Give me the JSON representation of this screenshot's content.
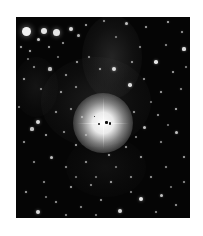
{
  "image": {
    "subject": "star field with bright central star and surrounding reflection nebula",
    "background_color": "#ffffff",
    "sky_color": "#050505",
    "frame": {
      "left": 16,
      "top": 17,
      "width": 174,
      "height": 201
    }
  },
  "central_star": {
    "x": 87,
    "y": 106,
    "core_radius": 8,
    "halo_radius": 30,
    "spike_length": 52,
    "color": "#ffffff"
  },
  "nebulae": [
    {
      "x": 96,
      "y": 40,
      "rx": 30,
      "ry": 42,
      "opacity": 0.16
    },
    {
      "x": 80,
      "y": 85,
      "rx": 55,
      "ry": 45,
      "opacity": 0.12
    },
    {
      "x": 20,
      "y": 70,
      "rx": 22,
      "ry": 30,
      "opacity": 0.08
    },
    {
      "x": 90,
      "y": 150,
      "rx": 40,
      "ry": 30,
      "opacity": 0.06
    }
  ],
  "core_blemishes": [
    {
      "x": 82,
      "y": 106,
      "w": 2,
      "h": 2
    },
    {
      "x": 89,
      "y": 104,
      "w": 3,
      "h": 3
    },
    {
      "x": 93,
      "y": 105,
      "w": 2,
      "h": 3
    },
    {
      "x": 78,
      "y": 99,
      "w": 1,
      "h": 1
    }
  ],
  "stars": [
    {
      "x": 10,
      "y": 14,
      "r": 4.5,
      "b": 0.95
    },
    {
      "x": 28,
      "y": 14,
      "r": 3,
      "b": 0.9
    },
    {
      "x": 40,
      "y": 15,
      "r": 3.5,
      "b": 0.9
    },
    {
      "x": 22,
      "y": 22,
      "r": 1.5,
      "b": 0.8
    },
    {
      "x": 55,
      "y": 12,
      "r": 2,
      "b": 0.85
    },
    {
      "x": 62,
      "y": 18,
      "r": 1.5,
      "b": 0.7
    },
    {
      "x": 5,
      "y": 30,
      "r": 1.2,
      "b": 0.7
    },
    {
      "x": 14,
      "y": 34,
      "r": 1.4,
      "b": 0.75
    },
    {
      "x": 33,
      "y": 30,
      "r": 1.2,
      "b": 0.7
    },
    {
      "x": 47,
      "y": 26,
      "r": 1.1,
      "b": 0.65
    },
    {
      "x": 70,
      "y": 8,
      "r": 1.3,
      "b": 0.7
    },
    {
      "x": 88,
      "y": 4,
      "r": 1.2,
      "b": 0.6
    },
    {
      "x": 110,
      "y": 6,
      "r": 1.5,
      "b": 0.75
    },
    {
      "x": 130,
      "y": 10,
      "r": 1.3,
      "b": 0.7
    },
    {
      "x": 152,
      "y": 5,
      "r": 1.4,
      "b": 0.75
    },
    {
      "x": 166,
      "y": 15,
      "r": 1.2,
      "b": 0.65
    },
    {
      "x": 168,
      "y": 32,
      "r": 1.6,
      "b": 0.85
    },
    {
      "x": 150,
      "y": 28,
      "r": 1.2,
      "b": 0.6
    },
    {
      "x": 140,
      "y": 45,
      "r": 1.8,
      "b": 0.9
    },
    {
      "x": 157,
      "y": 55,
      "r": 1.3,
      "b": 0.7
    },
    {
      "x": 124,
      "y": 30,
      "r": 1.1,
      "b": 0.6
    },
    {
      "x": 116,
      "y": 45,
      "r": 1.2,
      "b": 0.65
    },
    {
      "x": 98,
      "y": 52,
      "r": 2,
      "b": 0.85
    },
    {
      "x": 84,
      "y": 52,
      "r": 1.4,
      "b": 0.7
    },
    {
      "x": 73,
      "y": 40,
      "r": 1.2,
      "b": 0.6
    },
    {
      "x": 61,
      "y": 45,
      "r": 1.3,
      "b": 0.7
    },
    {
      "x": 50,
      "y": 58,
      "r": 1.2,
      "b": 0.65
    },
    {
      "x": 34,
      "y": 52,
      "r": 1.6,
      "b": 0.75
    },
    {
      "x": 18,
      "y": 50,
      "r": 1.1,
      "b": 0.6
    },
    {
      "x": 8,
      "y": 62,
      "r": 1.3,
      "b": 0.7
    },
    {
      "x": 25,
      "y": 72,
      "r": 1.2,
      "b": 0.6
    },
    {
      "x": 45,
      "y": 75,
      "r": 1.4,
      "b": 0.7
    },
    {
      "x": 60,
      "y": 70,
      "r": 1.1,
      "b": 0.6
    },
    {
      "x": 114,
      "y": 68,
      "r": 1.8,
      "b": 0.85
    },
    {
      "x": 128,
      "y": 62,
      "r": 1.2,
      "b": 0.65
    },
    {
      "x": 145,
      "y": 75,
      "r": 1.3,
      "b": 0.7
    },
    {
      "x": 165,
      "y": 72,
      "r": 1.2,
      "b": 0.6
    },
    {
      "x": 160,
      "y": 92,
      "r": 1.4,
      "b": 0.75
    },
    {
      "x": 142,
      "y": 98,
      "r": 1.2,
      "b": 0.65
    },
    {
      "x": 128,
      "y": 110,
      "r": 1.5,
      "b": 0.75
    },
    {
      "x": 118,
      "y": 95,
      "r": 1.2,
      "b": 0.65
    },
    {
      "x": 66,
      "y": 100,
      "r": 1.3,
      "b": 0.7
    },
    {
      "x": 55,
      "y": 92,
      "r": 1.1,
      "b": 0.6
    },
    {
      "x": 40,
      "y": 95,
      "r": 1.2,
      "b": 0.65
    },
    {
      "x": 22,
      "y": 105,
      "r": 2.2,
      "b": 0.85
    },
    {
      "x": 16,
      "y": 112,
      "r": 1.6,
      "b": 0.75
    },
    {
      "x": 30,
      "y": 118,
      "r": 1.3,
      "b": 0.7
    },
    {
      "x": 8,
      "y": 125,
      "r": 1.2,
      "b": 0.65
    },
    {
      "x": 48,
      "y": 115,
      "r": 1.2,
      "b": 0.6
    },
    {
      "x": 60,
      "y": 128,
      "r": 1.4,
      "b": 0.7
    },
    {
      "x": 35,
      "y": 140,
      "r": 1.5,
      "b": 0.75
    },
    {
      "x": 18,
      "y": 145,
      "r": 1.2,
      "b": 0.6
    },
    {
      "x": 50,
      "y": 150,
      "r": 1.2,
      "b": 0.6
    },
    {
      "x": 70,
      "y": 145,
      "r": 1.3,
      "b": 0.65
    },
    {
      "x": 93,
      "y": 138,
      "r": 1.4,
      "b": 0.7
    },
    {
      "x": 110,
      "y": 130,
      "r": 1.2,
      "b": 0.65
    },
    {
      "x": 125,
      "y": 140,
      "r": 1.3,
      "b": 0.7
    },
    {
      "x": 145,
      "y": 125,
      "r": 1.2,
      "b": 0.6
    },
    {
      "x": 160,
      "y": 115,
      "r": 1.5,
      "b": 0.75
    },
    {
      "x": 168,
      "y": 140,
      "r": 1.3,
      "b": 0.7
    },
    {
      "x": 150,
      "y": 150,
      "r": 1.2,
      "b": 0.6
    },
    {
      "x": 135,
      "y": 160,
      "r": 1.3,
      "b": 0.65
    },
    {
      "x": 115,
      "y": 160,
      "r": 1.2,
      "b": 0.6
    },
    {
      "x": 95,
      "y": 165,
      "r": 1.4,
      "b": 0.7
    },
    {
      "x": 75,
      "y": 168,
      "r": 1.2,
      "b": 0.6
    },
    {
      "x": 55,
      "y": 170,
      "r": 1.3,
      "b": 0.7
    },
    {
      "x": 28,
      "y": 165,
      "r": 1.2,
      "b": 0.6
    },
    {
      "x": 10,
      "y": 175,
      "r": 1.4,
      "b": 0.7
    },
    {
      "x": 40,
      "y": 185,
      "r": 1.3,
      "b": 0.65
    },
    {
      "x": 22,
      "y": 195,
      "r": 2,
      "b": 0.85
    },
    {
      "x": 65,
      "y": 190,
      "r": 1.2,
      "b": 0.6
    },
    {
      "x": 85,
      "y": 183,
      "r": 1.3,
      "b": 0.65
    },
    {
      "x": 104,
      "y": 194,
      "r": 1.9,
      "b": 0.85
    },
    {
      "x": 125,
      "y": 182,
      "r": 2.2,
      "b": 0.9
    },
    {
      "x": 145,
      "y": 178,
      "r": 1.5,
      "b": 0.75
    },
    {
      "x": 160,
      "y": 188,
      "r": 1.3,
      "b": 0.65
    },
    {
      "x": 168,
      "y": 165,
      "r": 1.2,
      "b": 0.6
    },
    {
      "x": 140,
      "y": 195,
      "r": 1.2,
      "b": 0.6
    },
    {
      "x": 115,
      "y": 175,
      "r": 1.1,
      "b": 0.55
    },
    {
      "x": 50,
      "y": 198,
      "r": 1.2,
      "b": 0.6
    },
    {
      "x": 80,
      "y": 198,
      "r": 1.1,
      "b": 0.55
    },
    {
      "x": 3,
      "y": 90,
      "r": 1.1,
      "b": 0.55
    },
    {
      "x": 170,
      "y": 50,
      "r": 1.1,
      "b": 0.55
    },
    {
      "x": 100,
      "y": 20,
      "r": 1.0,
      "b": 0.5
    },
    {
      "x": 12,
      "y": 42,
      "r": 1.0,
      "b": 0.5
    },
    {
      "x": 42,
      "y": 40,
      "r": 1.0,
      "b": 0.5
    },
    {
      "x": 135,
      "y": 85,
      "r": 1.0,
      "b": 0.5
    },
    {
      "x": 152,
      "y": 108,
      "r": 1.0,
      "b": 0.5
    },
    {
      "x": 100,
      "y": 150,
      "r": 1.0,
      "b": 0.5
    },
    {
      "x": 80,
      "y": 160,
      "r": 1.0,
      "b": 0.5
    },
    {
      "x": 60,
      "y": 160,
      "r": 1.0,
      "b": 0.5
    },
    {
      "x": 30,
      "y": 180,
      "r": 1.0,
      "b": 0.5
    },
    {
      "x": 155,
      "y": 170,
      "r": 1.0,
      "b": 0.5
    },
    {
      "x": 120,
      "y": 120,
      "r": 1.0,
      "b": 0.55
    },
    {
      "x": 70,
      "y": 118,
      "r": 1.1,
      "b": 0.6
    }
  ]
}
